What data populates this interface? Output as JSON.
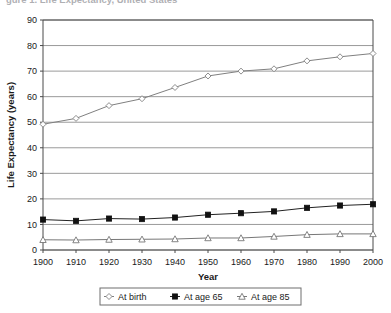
{
  "top_clipped_text": "gure 1. Life Expectancy, United States",
  "chart_data": {
    "type": "line",
    "title": "",
    "xlabel": "Year",
    "ylabel": "Life Expectancy (years)",
    "categories": [
      "1900",
      "1910",
      "1920",
      "1930",
      "1940",
      "1950",
      "1960",
      "1970",
      "1980",
      "1990",
      "2000"
    ],
    "x": [
      1900,
      1910,
      1920,
      1930,
      1940,
      1950,
      1960,
      1970,
      1980,
      1990,
      2000
    ],
    "xlim": [
      1900,
      2000
    ],
    "ylim": [
      0,
      90
    ],
    "ytick_labels": [
      "0",
      "10",
      "20",
      "30",
      "40",
      "50",
      "60",
      "70",
      "80",
      "90"
    ],
    "yticks": [
      0,
      10,
      20,
      30,
      40,
      50,
      60,
      70,
      80,
      90
    ],
    "grid": "horizontal",
    "legend_position": "bottom",
    "series": [
      {
        "name": "At birth",
        "marker": "open-diamond",
        "color": "#808080",
        "values": [
          49.2,
          51.5,
          56.5,
          59.2,
          63.6,
          68.1,
          70.0,
          70.9,
          74.0,
          75.6,
          76.9
        ]
      },
      {
        "name": "At age 65",
        "marker": "filled-square",
        "color": "#222222",
        "values": [
          11.9,
          11.4,
          12.3,
          12.1,
          12.7,
          13.8,
          14.4,
          15.1,
          16.5,
          17.4,
          17.9
        ]
      },
      {
        "name": "At age 85",
        "marker": "open-triangle",
        "color": "#777777",
        "values": [
          4.0,
          3.9,
          4.1,
          4.2,
          4.3,
          4.7,
          4.7,
          5.3,
          6.0,
          6.3,
          6.3
        ]
      }
    ]
  },
  "axes": {
    "y_title": "Life Expectancy (years)",
    "x_title": "Year"
  },
  "legend": {
    "items": [
      {
        "label": "At birth"
      },
      {
        "label": "At age 65"
      },
      {
        "label": "At age 85"
      }
    ]
  },
  "style": {
    "gridline_color": "#9a9a9a",
    "frame_color": "#4a4a4a",
    "background": "#ffffff"
  }
}
